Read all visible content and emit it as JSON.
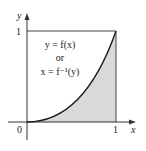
{
  "diagram": {
    "type": "function-graph",
    "axes": {
      "x_label": "x",
      "y_label": "y",
      "origin_label": "0",
      "x_tick_label": "1",
      "y_tick_label": "1"
    },
    "annotation": {
      "line1": "y = f(x)",
      "line2": "or",
      "line3": "x = f⁻¹(y)"
    },
    "colors": {
      "shade": "#d9d9d9",
      "curve": "#1a1a1a",
      "axis": "#333333",
      "frame": "#444444"
    }
  }
}
